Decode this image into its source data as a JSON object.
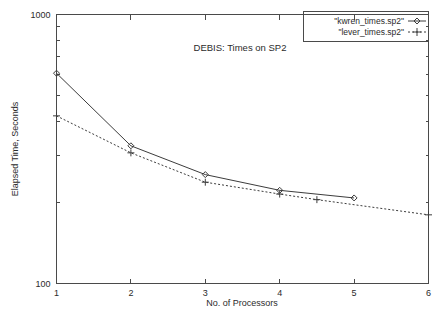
{
  "chart_data": {
    "type": "line",
    "title": "DEBIS: Times on SP2",
    "xlabel": "No. of Processors",
    "ylabel": "Elapsed Time, Seconds",
    "xlim": [
      1,
      6
    ],
    "ylim": [
      100,
      1000
    ],
    "yscale": "log",
    "xscale": "linear",
    "grid": false,
    "legend_position": "top-right",
    "xticks": [
      "1",
      "2",
      "3",
      "4",
      "5",
      "6"
    ],
    "xtick_values": [
      1,
      2,
      3,
      4,
      5,
      6
    ],
    "yticks": [
      "100",
      "1000"
    ],
    "ytick_values": [
      100,
      1000
    ],
    "series": [
      {
        "name": "\"kwren_times.sp2\"",
        "marker": "diamond",
        "linestyle": "solid",
        "color": "#3c3c3c",
        "x": [
          1,
          2,
          3,
          4,
          5
        ],
        "values": [
          605,
          325,
          254,
          222,
          208
        ]
      },
      {
        "name": "\"lever_times.sp2\"",
        "marker": "plus",
        "linestyle": "dashed",
        "color": "#3c3c3c",
        "x": [
          1,
          2,
          3,
          4,
          4.5,
          6
        ],
        "values": [
          420,
          306,
          238,
          215,
          205,
          180
        ]
      }
    ]
  },
  "legend": {
    "entries": [
      {
        "label": "\"kwren_times.sp2\"",
        "marker": "diamond-marker-icon"
      },
      {
        "label": "\"lever_times.sp2\"",
        "marker": "plus-marker-icon"
      }
    ]
  }
}
